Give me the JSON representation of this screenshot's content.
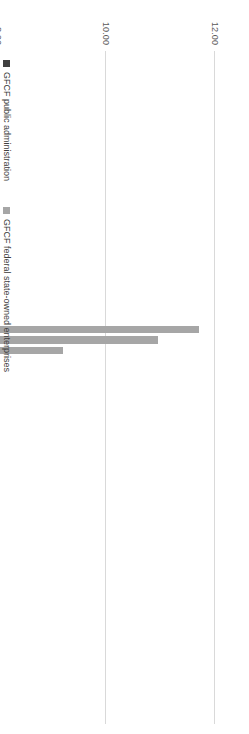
{
  "chart_data": {
    "type": "bar",
    "subtype": "stacked-horizontal",
    "title": "",
    "xlabel": "",
    "ylabel": "",
    "ylim": [
      0.0,
      12.0
    ],
    "grid": true,
    "legend_position": "right",
    "tick_labels": [
      "12.00",
      "10.00",
      "8.00",
      "6.00",
      "4.00",
      "2.00",
      "0.00"
    ],
    "tick_values": [
      12.0,
      10.0,
      8.0,
      6.0,
      4.0,
      2.0,
      0.0
    ],
    "categories": [
      "1950",
      "1951",
      "1952",
      "1953",
      "1954",
      "1955",
      "1956",
      "1957",
      "1958",
      "1959",
      "1960",
      "1961",
      "1962",
      "1963",
      "1964",
      "1965",
      "1966",
      "1967",
      "1968",
      "1969",
      "1970",
      "1971",
      "1972",
      "1973",
      "1974",
      "1975",
      "1976",
      "1977",
      "1978",
      "1979",
      "1980",
      "1981",
      "1982",
      "1983",
      "1984",
      "1985",
      "1986",
      "1987",
      "1988",
      "1989",
      "1990",
      "1991",
      "1992",
      "1993",
      "1994",
      "1995",
      "1996",
      "1997",
      "1998",
      "1999",
      "2000",
      "2001",
      "2002",
      "2003",
      "2004",
      "2005",
      "2006",
      "2007",
      "2008",
      "2009",
      "2010",
      "2011",
      "2012",
      "2013"
    ],
    "series": [
      {
        "name": "GFCF public administration",
        "color": "#404040",
        "values": [
          5.7,
          5.05,
          5.05,
          4.2,
          4.05,
          3.95,
          3.4,
          4.75,
          4.85,
          4.05,
          4.05,
          4.0,
          4.05,
          4.2,
          4.2,
          3.35,
          0.0,
          0.0,
          0.0,
          2.7,
          3.35,
          3.9,
          4.05,
          3.9,
          3.95,
          3.95,
          4.55,
          5.0,
          5.1,
          4.05,
          4.05,
          4.05,
          4.0,
          4.7,
          4.2,
          4.05,
          4.0,
          3.95,
          4.05,
          4.05,
          4.0,
          3.6,
          3.55,
          3.6,
          3.7,
          3.55,
          3.45,
          3.25,
          3.35,
          2.95,
          2.65,
          2.6,
          2.45,
          2.45,
          2.4,
          2.45,
          2.55,
          2.65,
          2.8,
          3.15,
          3.0,
          2.85,
          2.9,
          2.85
        ]
      },
      {
        "name": "GFCF federal state-owned enterprises",
        "color": "#a6a6a6",
        "values": [
          0.25,
          0.0,
          0.0,
          0.55,
          0.9,
          0.75,
          0.35,
          1.05,
          1.1,
          0.95,
          1.0,
          1.05,
          0.9,
          0.9,
          0.75,
          2.05,
          0.0,
          0.0,
          0.0,
          3.2,
          2.4,
          1.75,
          1.45,
          1.45,
          2.3,
          2.0,
          7.15,
          5.95,
          4.1,
          2.2,
          2.2,
          2.6,
          3.0,
          1.6,
          1.2,
          1.35,
          1.75,
          1.35,
          1.45,
          1.05,
          1.0,
          1.85,
          1.55,
          0.85,
          1.05,
          0.65,
          0.7,
          1.2,
          1.25,
          0.5,
          0.45,
          0.55,
          0.55,
          0.7,
          0.5,
          0.65,
          0.65,
          0.85,
          1.05,
          1.0,
          1.2,
          1.15,
          1.1,
          0.95
        ]
      }
    ]
  },
  "legend": {
    "items": [
      {
        "label": "GFCF public administration",
        "color": "#404040"
      },
      {
        "label": "GFCF federal state-owned enterprises",
        "color": "#a6a6a6"
      }
    ]
  }
}
